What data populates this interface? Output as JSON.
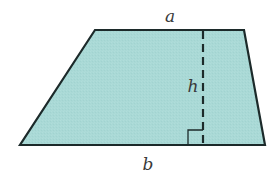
{
  "diagram": {
    "type": "trapezoid",
    "labels": {
      "top_base": "a",
      "bottom_base": "b",
      "height": "h"
    },
    "colors": {
      "fill": "#a9d9d6",
      "stroke": "#1c2a2a",
      "label": "#3a3a3a",
      "background": "#ffffff"
    },
    "elements": [
      {
        "name": "top-base",
        "label": "a",
        "style": "solid"
      },
      {
        "name": "bottom-base",
        "label": "b",
        "style": "solid"
      },
      {
        "name": "height",
        "label": "h",
        "style": "dashed"
      },
      {
        "name": "right-angle-marker",
        "label": "",
        "style": "solid"
      }
    ]
  }
}
